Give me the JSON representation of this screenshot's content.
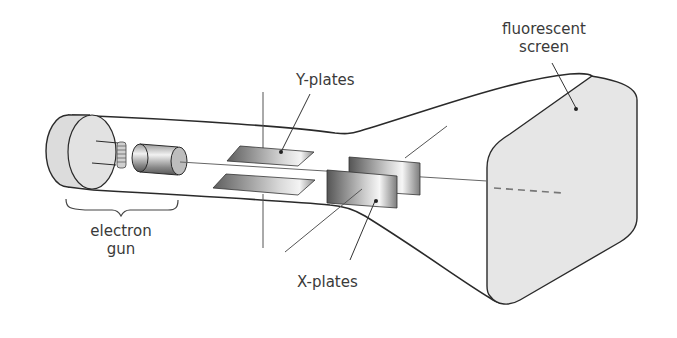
{
  "labels": {
    "y_plates": "Y-plates",
    "x_plates": "X-plates",
    "fluorescent_screen_line1": "fluorescent",
    "fluorescent_screen_line2": "screen",
    "electron_gun_line1": "electron",
    "electron_gun_line2": "gun"
  },
  "colors": {
    "outline": "#2a2a2a",
    "screen_fill": "#e8e8e8",
    "plate_dark": "#6a6a6a",
    "plate_light": "#f0f0f0",
    "text": "#3a3a3a"
  }
}
